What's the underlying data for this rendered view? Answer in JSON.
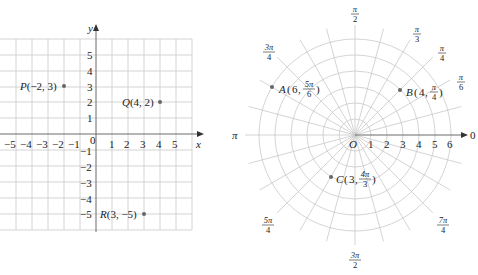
{
  "rectangular": {
    "x_axis_label": "x",
    "y_axis_label": "y",
    "origin_label": "0",
    "x_ticks": [
      "−5",
      "−4",
      "−3",
      "−2",
      "−1",
      "1",
      "2",
      "3",
      "4",
      "5"
    ],
    "y_ticks": [
      "5",
      "4",
      "3",
      "2",
      "1",
      "−1",
      "−2",
      "−3",
      "−4",
      "−5"
    ],
    "points": [
      {
        "name": "P",
        "coords": "(−2, 3)",
        "x": -2,
        "y": 3
      },
      {
        "name": "Q",
        "coords": "(4, 2)",
        "x": 4,
        "y": 2
      },
      {
        "name": "R",
        "coords": "(3, −5)",
        "x": 3,
        "y": -5
      }
    ]
  },
  "polar": {
    "pole_label": "O",
    "polar_axis_label": "0",
    "pi_label": "π",
    "radial_ticks": [
      "1",
      "2",
      "3",
      "4",
      "5",
      "6"
    ],
    "angle_labels": [
      {
        "num": "π",
        "den": "2",
        "angle": "π/2"
      },
      {
        "num": "π",
        "den": "3",
        "angle": "π/3"
      },
      {
        "num": "π",
        "den": "4",
        "angle": "π/4"
      },
      {
        "num": "π",
        "den": "6",
        "angle": "π/6"
      },
      {
        "num": "3π",
        "den": "4",
        "angle": "3π/4"
      },
      {
        "num": "5π",
        "den": "4",
        "angle": "5π/4"
      },
      {
        "num": "3π",
        "den": "2",
        "angle": "3π/2"
      },
      {
        "num": "7π",
        "den": "4",
        "angle": "7π/4"
      }
    ],
    "points": [
      {
        "name": "A",
        "r": "6",
        "theta_num": "5π",
        "theta_den": "6"
      },
      {
        "name": "B",
        "r": "4",
        "theta_num": "π",
        "theta_den": "4"
      },
      {
        "name": "C",
        "r": "3",
        "theta_num": "4π",
        "theta_den": "3"
      }
    ]
  },
  "colors": {
    "grid": "#c9c9c9",
    "axis": "#6a6a6a",
    "text": "#222222",
    "point": "#666666"
  }
}
